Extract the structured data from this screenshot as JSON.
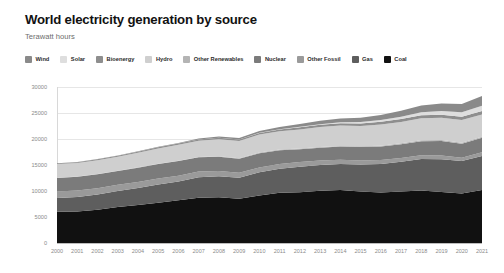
{
  "header": {
    "title": "World electricity generation by source",
    "subtitle": "Terawatt hours"
  },
  "chart_data": {
    "type": "area",
    "stacked": true,
    "title": "World electricity generation by source",
    "subtitle": "Terawatt hours",
    "xlabel": "",
    "ylabel": "Terawatt hours",
    "ylim": [
      0,
      30000
    ],
    "yticks": [
      0,
      5000,
      10000,
      15000,
      20000,
      25000,
      30000
    ],
    "ytick_labels": [
      "0",
      "5000",
      "10000",
      "15000",
      "20000",
      "25000",
      "30000"
    ],
    "grid": true,
    "legend_position": "top",
    "background": "#ffffff",
    "grid_color": "#e6e6e6",
    "axis_color": "#bdbdbd",
    "tick_label_color": "#8a8a8a",
    "x": [
      2000,
      2001,
      2002,
      2003,
      2004,
      2005,
      2006,
      2007,
      2008,
      2009,
      2010,
      2011,
      2012,
      2013,
      2014,
      2015,
      2016,
      2017,
      2018,
      2019,
      2020,
      2021
    ],
    "categories": [
      "2000",
      "2001",
      "2002",
      "2003",
      "2004",
      "2005",
      "2006",
      "2007",
      "2008",
      "2009",
      "2010",
      "2011",
      "2012",
      "2013",
      "2014",
      "2015",
      "2016",
      "2017",
      "2018",
      "2019",
      "2020",
      "2021"
    ],
    "stack_order_bottom_to_top": [
      "Coal",
      "Gas",
      "Other Fossil",
      "Nuclear",
      "Other Renewables",
      "Hydro",
      "Bioenergy",
      "Solar",
      "Wind"
    ],
    "series": [
      {
        "name": "Coal",
        "color": "#111111",
        "values": [
          5990,
          6060,
          6390,
          6900,
          7290,
          7760,
          8200,
          8700,
          8800,
          8500,
          9130,
          9670,
          9780,
          10060,
          10190,
          9900,
          9700,
          9900,
          10100,
          9800,
          9500,
          10200
        ]
      },
      {
        "name": "Gas",
        "color": "#5e5e5e",
        "values": [
          2680,
          2790,
          2960,
          3100,
          3280,
          3490,
          3650,
          3960,
          4050,
          4060,
          4460,
          4600,
          4890,
          4920,
          5000,
          5180,
          5500,
          5720,
          6050,
          6300,
          6250,
          6550
        ]
      },
      {
        "name": "Other Fossil",
        "color": "#9a9a9a",
        "values": [
          1250,
          1230,
          1200,
          1200,
          1180,
          1160,
          1100,
          1070,
          1020,
          940,
          930,
          930,
          900,
          870,
          820,
          790,
          760,
          740,
          730,
          720,
          660,
          680
        ]
      },
      {
        "name": "Nuclear",
        "color": "#7b7b7b",
        "values": [
          2590,
          2640,
          2660,
          2640,
          2740,
          2770,
          2800,
          2740,
          2730,
          2690,
          2760,
          2650,
          2460,
          2480,
          2530,
          2570,
          2610,
          2640,
          2700,
          2790,
          2690,
          2800
        ]
      },
      {
        "name": "Other Renewables",
        "color": "#b4b4b4",
        "values": [
          55,
          58,
          62,
          66,
          70,
          75,
          80,
          85,
          92,
          98,
          105,
          112,
          120,
          128,
          136,
          144,
          152,
          160,
          168,
          176,
          182,
          190
        ]
      },
      {
        "name": "Hydro",
        "color": "#cfcfcf",
        "values": [
          2620,
          2610,
          2660,
          2680,
          2810,
          2940,
          3060,
          3100,
          3260,
          3310,
          3460,
          3510,
          3690,
          3830,
          3900,
          3920,
          4080,
          4130,
          4250,
          4290,
          4390,
          4300
        ]
      },
      {
        "name": "Bioenergy",
        "color": "#8e8e8e",
        "values": [
          140,
          150,
          160,
          175,
          190,
          205,
          225,
          250,
          275,
          300,
          330,
          360,
          400,
          430,
          460,
          490,
          520,
          550,
          580,
          610,
          630,
          660
        ]
      },
      {
        "name": "Solar",
        "color": "#dedede",
        "values": [
          1,
          2,
          2,
          3,
          4,
          5,
          6,
          7,
          12,
          20,
          32,
          63,
          96,
          134,
          190,
          253,
          328,
          444,
          582,
          700,
          840,
          1030
        ]
      },
      {
        "name": "Wind",
        "color": "#8a8a8a",
        "values": [
          31,
          38,
          52,
          63,
          85,
          104,
          133,
          171,
          220,
          276,
          342,
          434,
          527,
          639,
          712,
          831,
          957,
          1127,
          1270,
          1420,
          1590,
          1860
        ]
      }
    ]
  },
  "legend": {
    "items": [
      {
        "label": "Wind",
        "color": "#8a8a8a"
      },
      {
        "label": "Solar",
        "color": "#dedede"
      },
      {
        "label": "Bioenergy",
        "color": "#8e8e8e"
      },
      {
        "label": "Hydro",
        "color": "#cfcfcf"
      },
      {
        "label": "Other Renewables",
        "color": "#b4b4b4"
      },
      {
        "label": "Nuclear",
        "color": "#7b7b7b"
      },
      {
        "label": "Other Fossil",
        "color": "#9a9a9a"
      },
      {
        "label": "Gas",
        "color": "#5e5e5e"
      },
      {
        "label": "Coal",
        "color": "#111111"
      }
    ]
  }
}
